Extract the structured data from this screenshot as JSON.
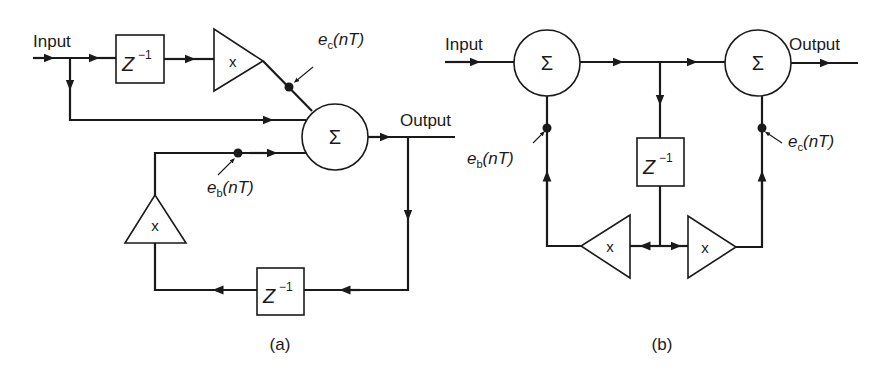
{
  "figure": {
    "panels": [
      {
        "id": "a",
        "caption": "(a)",
        "input_label": "Input",
        "output_label": "Output",
        "sum_symbol": "Σ",
        "delay_top": {
          "base": "Z",
          "exp": "−1"
        },
        "delay_bottom": {
          "base": "Z",
          "exp": "−1"
        },
        "mult_forward": "x",
        "mult_feedback": "x",
        "error_c": {
          "e": "e",
          "sub": "c",
          "arg": "(nT)"
        },
        "error_b": {
          "e": "e",
          "sub": "b",
          "arg": "(nT)"
        }
      },
      {
        "id": "b",
        "caption": "(b)",
        "input_label": "Input",
        "output_label": "Output",
        "sum_left_symbol": "Σ",
        "sum_right_symbol": "Σ",
        "delay": {
          "base": "Z",
          "exp": "−1"
        },
        "mult_left": "x",
        "mult_right": "x",
        "error_b": {
          "e": "e",
          "sub": "b",
          "arg": "(nT)"
        },
        "error_c": {
          "e": "e",
          "sub": "c",
          "arg": "(nT)"
        }
      }
    ]
  },
  "colors": {
    "ink": "#1a1a1a",
    "background": "#ffffff"
  }
}
